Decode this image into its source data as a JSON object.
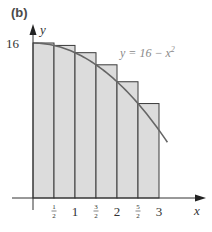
{
  "panel_label": "(b)",
  "chart_data": {
    "type": "area",
    "title": "",
    "function_label": "y = 16 − x",
    "function_exponent": "2",
    "xlabel": "x",
    "ylabel": "y",
    "xlim": [
      0,
      3
    ],
    "ylim": [
      0,
      16
    ],
    "x_ticks": [
      {
        "value": 0.5,
        "label": "1/2",
        "num": "1",
        "den": "2"
      },
      {
        "value": 1,
        "label": "1"
      },
      {
        "value": 1.5,
        "label": "3/2",
        "num": "3",
        "den": "2"
      },
      {
        "value": 2,
        "label": "2"
      },
      {
        "value": 2.5,
        "label": "5/2",
        "num": "5",
        "den": "2"
      },
      {
        "value": 3,
        "label": "3"
      }
    ],
    "y_ticks": [
      {
        "value": 16,
        "label": "16"
      }
    ],
    "rectangles": [
      {
        "x0": 0,
        "x1": 0.5,
        "height": 16
      },
      {
        "x0": 0.5,
        "x1": 1,
        "height": 15.75
      },
      {
        "x0": 1,
        "x1": 1.5,
        "height": 15
      },
      {
        "x0": 1.5,
        "x1": 2,
        "height": 13.75
      },
      {
        "x0": 2,
        "x1": 2.5,
        "height": 12
      },
      {
        "x0": 2.5,
        "x1": 3,
        "height": 9.75
      }
    ],
    "curve": {
      "expression": "16 - x^2",
      "x_start": 0,
      "x_end": 3.2
    },
    "colors": {
      "fill": "#dcdcdc",
      "stroke": "#3a3a3a",
      "curve": "#666666",
      "text": "#333333",
      "label_text": "#8a8a8a"
    },
    "grid": false,
    "legend": null
  }
}
